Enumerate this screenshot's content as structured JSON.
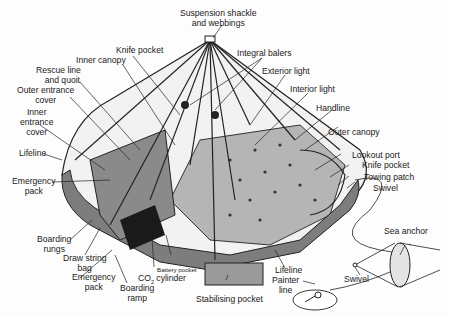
{
  "diagram": {
    "colors": {
      "ink": "#1a1a1a",
      "fabric": "#8f8f8f",
      "floor": "#b8b8b8",
      "canopy": "#f4f4f4"
    },
    "labels": {
      "suspension": "Suspension shackle",
      "suspension2": "and webbings",
      "knife_pocket_top": "Knife pocket",
      "integral_balers": "Integral balers",
      "inner_canopy": "Inner canopy",
      "exterior_light": "Exterior light",
      "rescue_line": "Rescue line",
      "rescue_line2": "and quoit",
      "interior_light": "Interior light",
      "outer_entrance": "Outer entrance",
      "outer_entrance2": "cover",
      "handline": "Handline",
      "inner_entrance": "Inner",
      "inner_entrance2": "entrance",
      "inner_entrance3": "cover",
      "outer_canopy": "Outer canopy",
      "lifeline_left": "Lifeline",
      "lookout_port": "Lookout port",
      "knife_pocket_right": "Knife pocket",
      "emergency_pack_top": "Emergency",
      "emergency_pack_top2": "pack",
      "towing_patch": "Towing patch",
      "swivel_top": "Swivel",
      "sea_anchor": "Sea anchor",
      "boarding_rungs": "Boarding",
      "boarding_rungs2": "rungs",
      "draw_string": "Draw string",
      "draw_string2": "bag",
      "emergency_pack_bottom": "Emergency",
      "emergency_pack_bottom2": "pack",
      "battery_pocket": "Battery pocket",
      "co2": "CO",
      "co2_sub": "2",
      "co2_rest": " cylinder",
      "boarding_ramp": "Boarding",
      "boarding_ramp2": "ramp",
      "lifeline_bottom": "Lifeline",
      "painter_line": "Painter",
      "painter_line2": "line",
      "swivel_bottom": "Swivel",
      "stabilising_pocket": "Stabilising pocket"
    }
  }
}
